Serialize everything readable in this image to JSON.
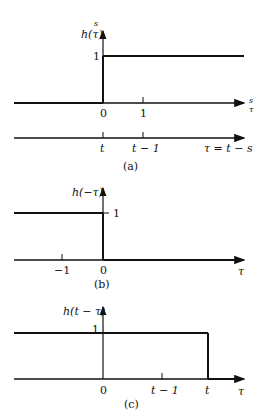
{
  "panels": {
    "a": {
      "caption": "(a)",
      "ylabel": "h(τ)",
      "ylabel_super": "s",
      "y_tick": "1",
      "x_ticks": [
        "0",
        "1"
      ],
      "x_axis_label_top": "s",
      "x_axis_label_bottom": "τ",
      "second_axis_ticks": [
        "t",
        "t − 1"
      ],
      "second_axis_label": "τ = t − s"
    },
    "b": {
      "caption": "(b)",
      "ylabel": "h(−τ)",
      "y_tick": "1",
      "x_ticks": [
        "−1",
        "0"
      ],
      "x_axis_label": "τ"
    },
    "c": {
      "caption": "(c)",
      "ylabel": "h(t − τ)",
      "y_tick": "1",
      "x_ticks": [
        "0",
        "t − 1",
        "t"
      ],
      "x_axis_label": "τ"
    }
  },
  "colors": {
    "line": "#111111",
    "background": "#ffffff"
  }
}
